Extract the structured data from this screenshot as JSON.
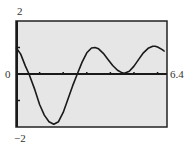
{
  "chart_data": {
    "type": "line",
    "title": "",
    "xlabel": "",
    "ylabel": "",
    "xlim": [
      0,
      6.4
    ],
    "ylim": [
      -2,
      2
    ],
    "grid": false,
    "legend": null,
    "tick_labels": {
      "y_top": "2",
      "y_bottom": "−2",
      "x_left": "0",
      "x_right": "6.4"
    },
    "x_ticks": [
      1,
      2,
      3,
      4,
      5,
      6
    ],
    "y_ticks": [
      -1,
      1
    ],
    "series": [
      {
        "name": "f(x)",
        "x": [
          0,
          0.2,
          0.4,
          0.55,
          0.8,
          1.0,
          1.2,
          1.4,
          1.6,
          1.8,
          2.0,
          2.2,
          2.4,
          2.6,
          2.8,
          3.0,
          3.2,
          3.35,
          3.5,
          3.7,
          3.9,
          4.1,
          4.3,
          4.5,
          4.6,
          4.8,
          5.0,
          5.2,
          5.4,
          5.6,
          5.8,
          5.9,
          6.0,
          6.2,
          6.3
        ],
        "values": [
          1.0,
          0.75,
          0.3,
          0.0,
          -0.6,
          -1.15,
          -1.55,
          -1.8,
          -1.9,
          -1.8,
          -1.45,
          -0.95,
          -0.45,
          0.0,
          0.45,
          0.8,
          0.98,
          1.0,
          0.95,
          0.78,
          0.55,
          0.32,
          0.14,
          0.04,
          0.03,
          0.1,
          0.3,
          0.55,
          0.8,
          0.97,
          1.05,
          1.05,
          1.02,
          0.92,
          0.85
        ]
      }
    ]
  },
  "colors": {
    "plot_background": "#e6e6e6",
    "frame": "#222222",
    "curve": "#1a1a1a",
    "axis": "#1a1a1a",
    "label": "#333333"
  }
}
